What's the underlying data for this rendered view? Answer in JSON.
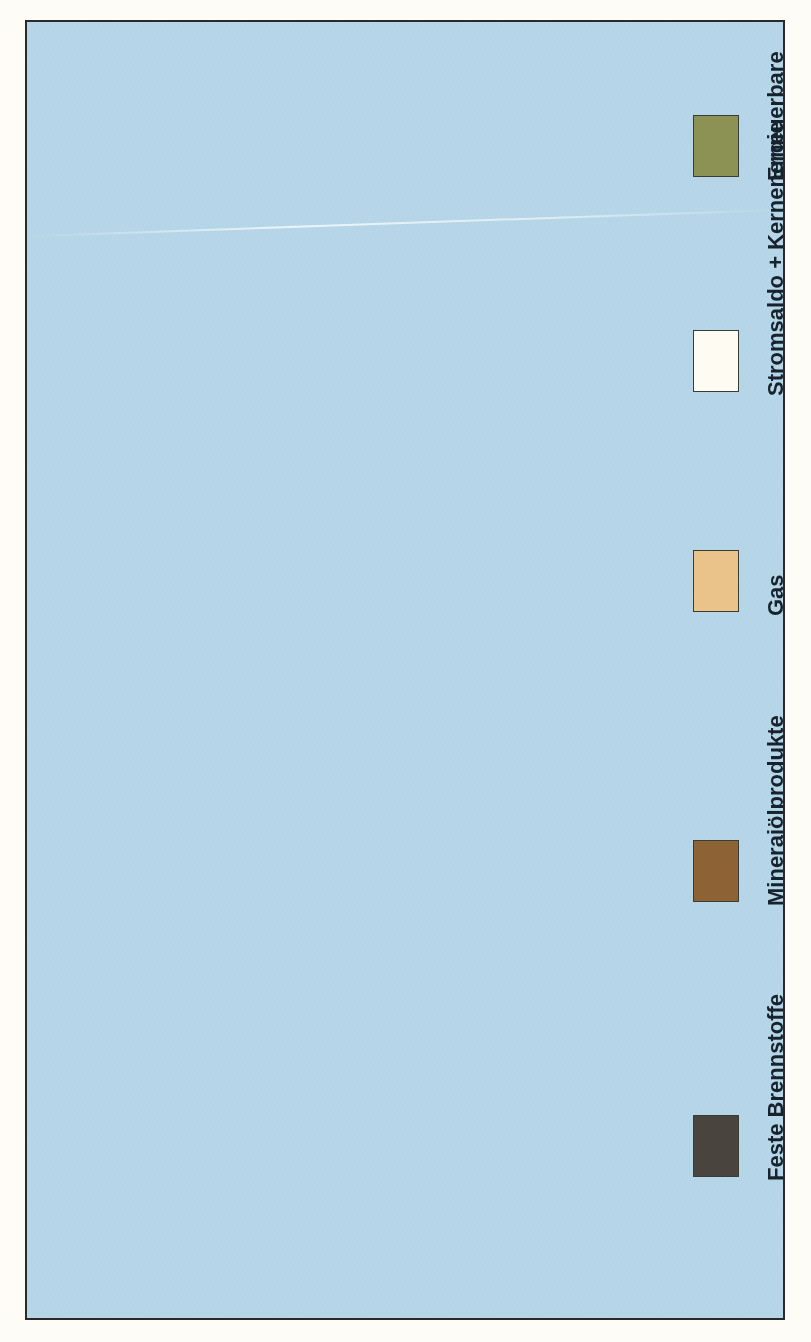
{
  "figure": {
    "unit_label": "PJ",
    "category_axis_title": "Jahre",
    "background_color": "#b4d6e8",
    "plot_color": "#dfe9e9"
  },
  "legend": {
    "position": "right",
    "items": [
      {
        "label": "Feste Brennstoffe",
        "color": "#4a443e",
        "key": "feste"
      },
      {
        "label": "Mineraiölprodukte",
        "color": "#8d6336",
        "key": "oel"
      },
      {
        "label": "Gas",
        "color": "#e9c389",
        "key": "gas"
      },
      {
        "label": "Stromsaldo + Kernenergie",
        "color": "#fdfbf2",
        "key": "strom"
      },
      {
        "label": "Erneuerbare",
        "color": "#8b9253",
        "key": "erneu"
      }
    ]
  },
  "chart_data": {
    "type": "bar",
    "orientation": "horizontal",
    "stacked": true,
    "title": "",
    "xlabel": "PJ",
    "ylabel": "Jahre",
    "xlim": [
      0,
      15000
    ],
    "xticks": [
      0,
      5000,
      10000,
      15000
    ],
    "xticklabels": [
      "0",
      "5 000",
      "10 000",
      "15 000"
    ],
    "grid": true,
    "groups": [
      "1990",
      "2005",
      "2020"
    ],
    "categories": [
      "REF",
      "REF",
      "R3",
      "R4",
      "REF",
      "R3",
      "R4"
    ],
    "group_of_category": [
      "1990",
      "2005",
      "2005",
      "2005",
      "2020",
      "2020",
      "2020"
    ],
    "series": [
      {
        "name": "Feste Brennstoffe",
        "color": "#4a443e",
        "values": [
          5100,
          3450,
          3450,
          3450,
          3350,
          3300,
          3300
        ]
      },
      {
        "name": "Mineraiölprodukte",
        "color": "#8d6336",
        "values": [
          5450,
          5900,
          5700,
          5750,
          5550,
          5300,
          5700
        ]
      },
      {
        "name": "Gas",
        "color": "#e9c389",
        "values": [
          2450,
          2350,
          2450,
          2700,
          2450,
          2050,
          2750
        ]
      },
      {
        "name": "Stromsaldo + Kernenergie",
        "color": "#fdfbf2",
        "values": [
          1450,
          1800,
          1850,
          250,
          1800,
          1800,
          200
        ]
      },
      {
        "name": "Erneuerbare",
        "color": "#8b9253",
        "values": [
          350,
          550,
          550,
          550,
          650,
          700,
          550
        ]
      }
    ],
    "totals": [
      14800,
      14050,
      14000,
      14700,
      13800,
      13150,
      12500
    ]
  },
  "axis": {
    "value_ticks": [
      {
        "label": "15 000",
        "value": 15000
      },
      {
        "label": "10 000",
        "value": 10000
      },
      {
        "label": "5 000",
        "value": 5000
      },
      {
        "label": "0",
        "value": 0
      }
    ],
    "category_ticks": [
      {
        "label": "REF",
        "group": "1990"
      },
      {
        "label": "REF",
        "group": "2005"
      },
      {
        "label": "R3",
        "group": "2005"
      },
      {
        "label": "R4",
        "group": "2005"
      },
      {
        "label": "REF",
        "group": "2020"
      },
      {
        "label": "R3",
        "group": "2020"
      },
      {
        "label": "R4",
        "group": "2020"
      }
    ],
    "group_labels": [
      "1990",
      "2005",
      "2020"
    ]
  }
}
